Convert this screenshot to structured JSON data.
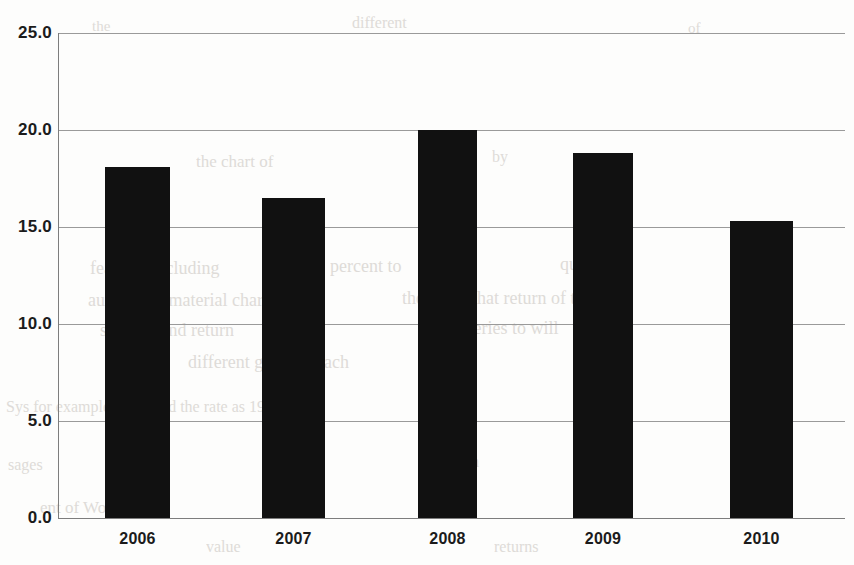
{
  "chart_data": {
    "type": "bar",
    "title": "",
    "subtitle": "",
    "xlabel": "",
    "ylabel": "",
    "categories": [
      "2006",
      "2007",
      "2008",
      "2009",
      "2010"
    ],
    "values": [
      18.1,
      16.5,
      20.0,
      18.8,
      15.3
    ],
    "series": [
      {
        "name": "",
        "values": [
          18.1,
          16.5,
          20.0,
          18.8,
          15.3
        ]
      }
    ],
    "ylim": [
      0.0,
      25.0
    ],
    "ytick_labels": [
      "25.0",
      "20.0",
      "15.0",
      "10.0",
      "5.0",
      "0.0"
    ],
    "ytick_values": [
      25.0,
      20.0,
      15.0,
      10.0,
      5.0,
      0.0
    ],
    "xtick_labels": [
      "2006",
      "2007",
      "2008",
      "2009",
      "2010"
    ],
    "grid": true,
    "grid_axis": "y",
    "legend": false,
    "legend_position": "none",
    "bar_color": "#111111",
    "grid_color": "#9a9a9a",
    "axis_color": "#7d7d7d",
    "background_color": "#fdfdfc",
    "annotations": []
  },
  "ghost_text": {
    "note": "faint bleed-through of printed page text behind the scanned chart",
    "lines": [
      {
        "text": "the",
        "x": 92,
        "y": 18,
        "size": 15
      },
      {
        "text": "different",
        "x": 352,
        "y": 14,
        "size": 16
      },
      {
        "text": "of",
        "x": 688,
        "y": 20,
        "size": 15
      },
      {
        "text": "the chart of",
        "x": 196,
        "y": 152,
        "size": 17
      },
      {
        "text": "by",
        "x": 492,
        "y": 148,
        "size": 16
      },
      {
        "text": "features including",
        "x": 90,
        "y": 258,
        "size": 18
      },
      {
        "text": "percent to",
        "x": 330,
        "y": 256,
        "size": 18
      },
      {
        "text": "quality in",
        "x": 560,
        "y": 254,
        "size": 18
      },
      {
        "text": "authorized material chart",
        "x": 88,
        "y": 290,
        "size": 18
      },
      {
        "text": "the value that return of the",
        "x": 402,
        "y": 288,
        "size": 18
      },
      {
        "text": "specific and return",
        "x": 100,
        "y": 320,
        "size": 18
      },
      {
        "text": "the series to will",
        "x": 440,
        "y": 318,
        "size": 18
      },
      {
        "text": "different gains of each",
        "x": 188,
        "y": 352,
        "size": 18
      },
      {
        "text": "Sys for example explained the rate as 1990",
        "x": 6,
        "y": 398,
        "size": 16
      },
      {
        "text": "sages",
        "x": 8,
        "y": 456,
        "size": 16
      },
      {
        "text": "Market",
        "x": 268,
        "y": 452,
        "size": 17
      },
      {
        "text": "Shown",
        "x": 432,
        "y": 452,
        "size": 17
      },
      {
        "text": "ent of Work Profit",
        "x": 40,
        "y": 498,
        "size": 17
      },
      {
        "text": "2",
        "x": 300,
        "y": 496,
        "size": 17
      },
      {
        "text": "2",
        "x": 456,
        "y": 496,
        "size": 17
      },
      {
        "text": "value",
        "x": 206,
        "y": 538,
        "size": 16
      },
      {
        "text": "returns",
        "x": 494,
        "y": 538,
        "size": 16
      }
    ]
  }
}
